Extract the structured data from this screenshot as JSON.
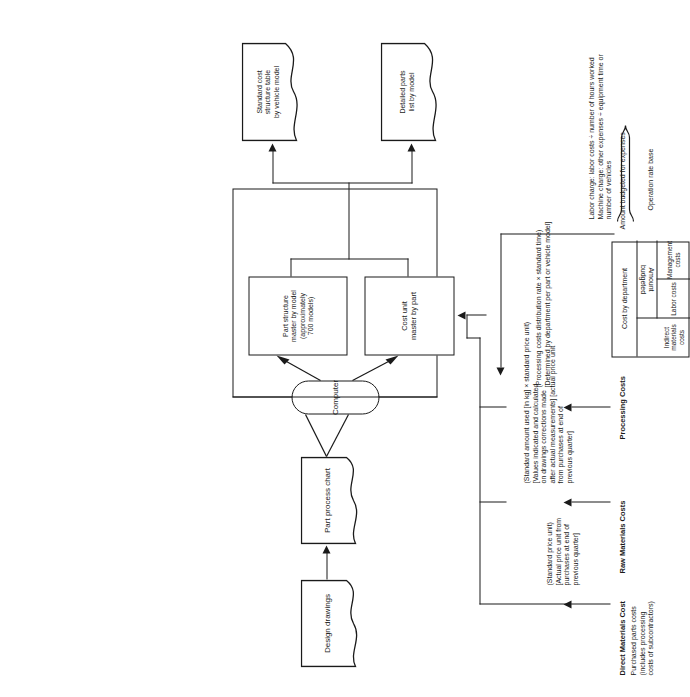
{
  "figure": {
    "orientation": "rotated-90-ccw",
    "ink_color": "#1a1a1a",
    "background": "#ffffff"
  },
  "flow": {
    "design_drawings": "Design drawings",
    "part_process_chart": "Part process chart",
    "computer": "Computer",
    "part_structure_master": "Part structure\nmaster by model\n(approximately\n700 models)",
    "cost_unit_master": "Cost unit\nmaster by part",
    "standard_cost_table": "Standard cost\nstructure table\nby vehicle model",
    "detailed_parts_list": "Detailed parts\nlist by model"
  },
  "inputs": [
    {
      "id": "direct-materials-cost",
      "heading": "Direct Materials Cost",
      "subtitle": "Purchased parts costs\n(includes processing\ncosts of subcontractors)",
      "note": "(Standard price unit)\n[Actual price unit from\npurchases at end of\nprevious quarter]"
    },
    {
      "id": "raw-materials-costs",
      "heading": "Raw Materials Costs",
      "subtitle": "",
      "note": "(Standard amount used [in kg]  ×  standard price unit)\n[Values indicated and calculated\non drawings      corrections made\nafter actual measurements] [actual price unit\nfrom purchases at end of\nprevious quarter]"
    },
    {
      "id": "processing-costs",
      "heading": "Processing Costs",
      "subtitle": "",
      "note": "(Processing costs distribution rate × standard time)\n[Determined by department per part or vehicle model]"
    }
  ],
  "processing_costs_table": {
    "title": "Processing Costs",
    "column_headers": [
      "Cost by department",
      "Amount\nbudgeted"
    ],
    "rows": [
      "Indirect\nmaterials costs",
      "Labor costs",
      "Management\ncosts"
    ]
  },
  "rate_base": {
    "amount_budgeted_label": "Amount budgeted for expenses",
    "operation_rate_base_label": "Operation rate base",
    "formulas": "Labor charge: labor costs ÷ number of hours worked\nMachine charge: other expenses ÷ equipment time or\nnumber of vehicles"
  },
  "icons": {
    "document_shape": "document-icon",
    "database_shape": "database-icon",
    "process_shape": "process-icon",
    "brace": "curly-brace-icon",
    "arrow": "arrow-icon"
  }
}
